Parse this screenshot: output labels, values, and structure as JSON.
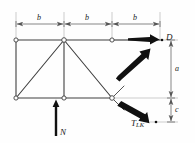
{
  "figure": {
    "background_color": "#fefefe",
    "line_color": "#3a3a3a",
    "dimension_color": "#555555",
    "force_color": "#111111",
    "width": 195,
    "height": 143
  },
  "dimensions": {
    "horizontal": [
      {
        "label": "b",
        "x": 40,
        "y": 18
      },
      {
        "label": "b",
        "x": 88,
        "y": 18
      },
      {
        "label": "b",
        "x": 136,
        "y": 18
      }
    ],
    "vertical": [
      {
        "label": "a",
        "x": 174,
        "y": 65
      },
      {
        "label": "c",
        "x": 174,
        "y": 107
      }
    ]
  },
  "forces": [
    {
      "name": "N",
      "label": "N",
      "sub": "",
      "direction": "up",
      "x": 62,
      "y": 132
    },
    {
      "name": "D",
      "label": "D",
      "sub": "",
      "direction": "right",
      "x": 168,
      "y": 38
    },
    {
      "name": "T_LK",
      "label": "T",
      "sub": "LK",
      "direction": "down-right",
      "x": 136,
      "y": 126
    },
    {
      "name": "diagonal-force",
      "label": "",
      "sub": "",
      "direction": "up-right",
      "x": 0,
      "y": 0
    }
  ],
  "nodes": {
    "top": [
      {
        "x": 16,
        "y": 40
      },
      {
        "x": 64,
        "y": 40
      },
      {
        "x": 112,
        "y": 40
      }
    ],
    "bottom": [
      {
        "x": 16,
        "y": 98
      },
      {
        "x": 64,
        "y": 98
      },
      {
        "x": 112,
        "y": 98
      }
    ]
  },
  "members": {
    "top_chord": [
      [
        16,
        40,
        160,
        40
      ]
    ],
    "bottom_chord": [
      [
        16,
        98,
        112,
        98
      ]
    ],
    "verticals": [
      [
        16,
        40,
        16,
        98
      ],
      [
        64,
        40,
        64,
        98
      ]
    ],
    "diagonals": [
      [
        16,
        98,
        64,
        40
      ],
      [
        64,
        40,
        112,
        98
      ]
    ]
  },
  "point_markers": [
    {
      "name": "point-D",
      "x": 162,
      "y": 40
    },
    {
      "name": "point-T",
      "x": 156,
      "y": 122
    }
  ]
}
